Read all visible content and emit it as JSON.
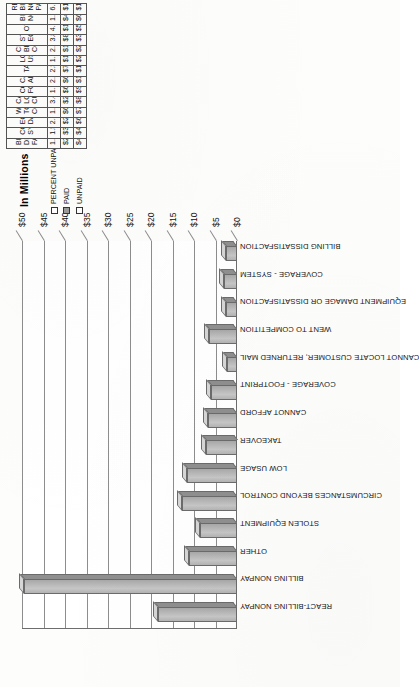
{
  "chart_data": {
    "type": "bar",
    "title": "",
    "axis_title": "In Millions",
    "xlabel": "",
    "ylabel": "In Millions",
    "ylim": [
      0,
      50
    ],
    "ytick_step": 5,
    "ytick_labels": [
      "$0",
      "$5",
      "$10",
      "$15",
      "$20",
      "$25",
      "$30",
      "$35",
      "$40",
      "$45",
      "$50"
    ],
    "ytick_values": [
      0,
      5,
      10,
      15,
      20,
      25,
      30,
      35,
      40,
      45,
      50
    ],
    "grid": true,
    "legend_position": "table-row-headers",
    "value_units": "thousands of dollars (plotted in millions)",
    "categories": [
      "REACT-BILLING NONPAY",
      "BILLING NONPAY",
      "OTHER",
      "STOLEN EQUIPMENT",
      "CIRCUMSTANCES BEYOND CONTROL",
      "LOW USAGE",
      "TAKEOVER",
      "CANNOT AFFORD",
      "COVERAGE - FOOTPRINT",
      "CANNOT LOCATE CUSTOMER, RETURNED MAIL",
      "WENT TO COMPETITION",
      "EQUIPMENT DAMAGE OR DISSATISFACTION",
      "COVERAGE - SYSTEM",
      "BILLING DISSATISFACTION"
    ],
    "series": [
      {
        "name": "PAID",
        "values": [
          18422,
          49567,
          11244,
          8586,
          12795,
          11633,
          7326,
          6742,
          6136,
          2399,
          6409,
          2491,
          3011,
          2640
        ]
      }
    ]
  },
  "table": {
    "row_headers": [
      {
        "label": "PERCENT UNPAID",
        "marker": "legend-marker-open"
      },
      {
        "label": "PAID",
        "marker": "legend-marker-filled"
      },
      {
        "label": "UNPAID",
        "marker": "legend-marker-open"
      }
    ],
    "columns": [
      {
        "header": "BILLING DISSATIS-FACTION",
        "percent_unpaid": "1.57%",
        "paid": "$2,640",
        "unpaid": "$42"
      },
      {
        "header": "COVERAGE-SYSTEM",
        "percent_unpaid": "1.57%",
        "paid": "$3,011",
        "unpaid": "$48"
      },
      {
        "header": "EQUIPMENT DAMAGE",
        "percent_unpaid": "2.50%",
        "paid": "$2,491",
        "unpaid": "$64"
      },
      {
        "header": "WENT TO COMPETITION",
        "percent_unpaid": "1.10%",
        "paid": "$6,409",
        "unpaid": "$71"
      },
      {
        "header": "CANNOT LOCATE CUSTOMER",
        "percent_unpaid": "3.40%",
        "paid": "$2,399",
        "unpaid": "$85"
      },
      {
        "header": "COVERAGE-FOOTPRINT",
        "percent_unpaid": "1.51%",
        "paid": "$6,136",
        "unpaid": "$94"
      },
      {
        "header": "CANNOT AFFORT",
        "percent_unpaid": "2.12%",
        "paid": "$6,742",
        "unpaid": "$146"
      },
      {
        "header": "TAKEOVER",
        "percent_unpaid": "2.31%",
        "paid": "$7,326",
        "unpaid": "$173"
      },
      {
        "header": "LOW USAGE",
        "percent_unpaid": "1.81%",
        "paid": "$11,633",
        "unpaid": "$215"
      },
      {
        "header": "CIRCUMSTANCES BEYOND CONTROL",
        "percent_unpaid": "2.23%",
        "paid": "$12,795",
        "unpaid": "$292"
      },
      {
        "header": "STOLEN EQUIPMENT",
        "percent_unpaid": "3.82%",
        "paid": "$8,586",
        "unpaid": "$341"
      },
      {
        "header": "OTHER",
        "percent_unpaid": "4.53%",
        "paid": "$11,244",
        "unpaid": "$534"
      },
      {
        "header": "BILLING NONPAY",
        "percent_unpaid": "1.27%",
        "paid": "$49,567",
        "unpaid": "$640"
      },
      {
        "header": "REACT-BILLING NON PAY",
        "percent_unpaid": "6.51%",
        "paid": "$18,422",
        "unpaid": "$1,282"
      }
    ]
  },
  "colors": {
    "bar_front": "#bcbcbc",
    "bar_side": "#8f8f8f",
    "bar_top": "#d6d6d6",
    "grid": "#8d8d8d",
    "text": "#111111",
    "paper": "#fdfdfc"
  }
}
